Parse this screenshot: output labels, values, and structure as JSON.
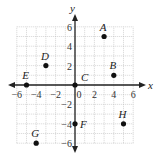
{
  "chart_data": {
    "type": "scatter",
    "title": "",
    "xlabel": "x",
    "ylabel": "y",
    "xlim": [
      -6,
      6
    ],
    "ylim": [
      -6,
      6
    ],
    "grid": true,
    "x_ticks": [
      -6,
      -4,
      -2,
      0,
      2,
      4,
      6
    ],
    "y_ticks": [
      -6,
      -4,
      -2,
      2,
      4,
      6
    ],
    "points": [
      {
        "label": "A",
        "x": 3,
        "y": 5
      },
      {
        "label": "B",
        "x": 4,
        "y": 1
      },
      {
        "label": "C",
        "x": 0,
        "y": 0
      },
      {
        "label": "D",
        "x": -3,
        "y": 2
      },
      {
        "label": "E",
        "x": -5,
        "y": 0
      },
      {
        "label": "F",
        "x": 0,
        "y": -4
      },
      {
        "label": "G",
        "x": -4,
        "y": -6
      },
      {
        "label": "H",
        "x": 5,
        "y": -4
      }
    ]
  },
  "colors": {
    "grid": "#b8b8b8",
    "axis": "#222222",
    "point": "#111111"
  }
}
